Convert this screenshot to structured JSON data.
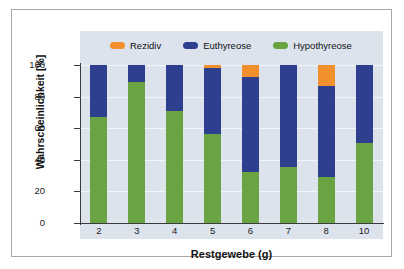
{
  "chart_data": {
    "type": "bar",
    "subtype": "stacked-bar-100-percent",
    "title": "",
    "xlabel": "Restgewebe (g)",
    "ylabel": "Wahrscheinlichkeit [%]",
    "categories": [
      "2",
      "3",
      "4",
      "5",
      "6",
      "7",
      "8",
      "10"
    ],
    "ylim": [
      0,
      100
    ],
    "yticks": [
      "0",
      "20",
      "40",
      "60",
      "80",
      "100"
    ],
    "ytick_values": [
      0,
      20,
      40,
      60,
      80,
      100
    ],
    "grid": true,
    "legend_position": "top-inside",
    "stack_order_bottom_to_top": [
      "Hypothyreose",
      "Euthyreose",
      "Rezidiv"
    ],
    "series": [
      {
        "name": "Hypothyreose",
        "color": "#6aa442",
        "values": [
          67,
          89.5,
          71,
          56.5,
          32,
          35.5,
          29,
          50.5
        ]
      },
      {
        "name": "Euthyreose",
        "color": "#2e3f8f",
        "values": [
          33,
          10.5,
          29,
          41.5,
          60.5,
          64.5,
          58,
          49.5
        ]
      },
      {
        "name": "Rezidiv",
        "color": "#f2902e",
        "values": [
          0,
          0,
          0,
          2,
          7.5,
          0,
          13,
          0
        ]
      }
    ]
  },
  "legend": {
    "items": [
      {
        "label": "Rezidiv",
        "color": "#f2902e"
      },
      {
        "label": "Euthyreose",
        "color": "#2e3f8f"
      },
      {
        "label": "Hypothyreose",
        "color": "#6aa442"
      }
    ]
  },
  "colors": {
    "plot_background": "#dde3ed",
    "page_background": "#ffffff",
    "frame_border": "#a8a8a8",
    "axis": "#3a3a3a",
    "gridline": "#f2f5fa",
    "text": "#111111"
  }
}
